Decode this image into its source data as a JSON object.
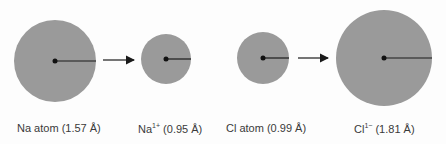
{
  "diagram": {
    "fill_color": "#9a9a9a",
    "line_color": "#1a1a1a",
    "items": [
      {
        "id": "na-atom",
        "label": "Na atom (1.57 Å)",
        "species": "Na atom",
        "radius_angstrom": 1.57,
        "cx": 55,
        "cy": 61,
        "r": 41
      },
      {
        "id": "na-ion",
        "symbol": "Na",
        "charge": "1+",
        "value": "(0.95 Å)",
        "radius_angstrom": 0.95,
        "cx": 166,
        "cy": 59,
        "r": 25
      },
      {
        "id": "cl-atom",
        "label": "Cl atom (0.99 Å)",
        "species": "Cl atom",
        "radius_angstrom": 0.99,
        "cx": 263,
        "cy": 58,
        "r": 26
      },
      {
        "id": "cl-ion",
        "symbol": "Cl",
        "charge": "1−",
        "value": "(1.81 Å)",
        "radius_angstrom": 1.81,
        "cx": 384,
        "cy": 58,
        "r": 48
      }
    ],
    "arrows": [
      {
        "from": "na-atom",
        "to": "na-ion",
        "x1": 103,
        "x2": 134,
        "y": 60
      },
      {
        "from": "cl-atom",
        "to": "cl-ion",
        "x1": 298,
        "x2": 328,
        "y": 58
      }
    ]
  }
}
